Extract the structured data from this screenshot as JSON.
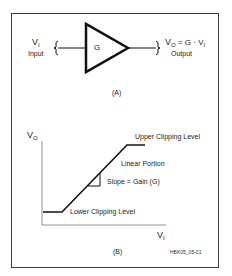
{
  "figure": {
    "panel_a": {
      "label": "(A)",
      "input": {
        "symbol": "V",
        "subscript": "I",
        "caption": "Input"
      },
      "amplifier": {
        "label": "G"
      },
      "output": {
        "symbol": "V",
        "subscript": "O",
        "equation_mid": " = G · V",
        "equation_sub": "I",
        "caption": "Output"
      }
    },
    "panel_b": {
      "label": "(B)",
      "y_axis": {
        "symbol": "V",
        "subscript": "O"
      },
      "x_axis": {
        "symbol": "V",
        "subscript": "I"
      },
      "annotations": {
        "upper": "Upper Clipping Level",
        "linear": "Linear Portion",
        "slope": "Slope = Gain (G)",
        "lower": "Lower Clipping Level"
      }
    },
    "figure_id": "HBK05_05-01"
  },
  "colors": {
    "line": "#111111",
    "axis": "#777777",
    "border": "#3a3a3a",
    "text": "#222222"
  }
}
